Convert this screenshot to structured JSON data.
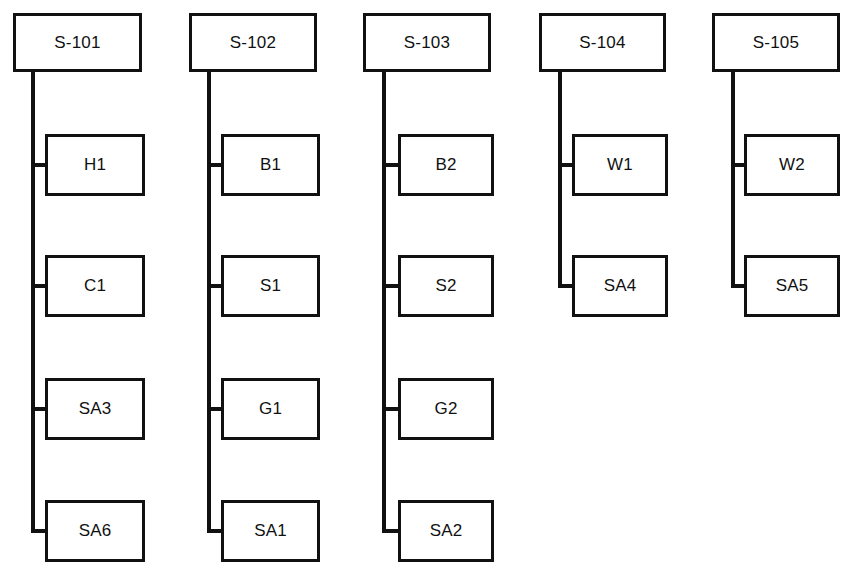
{
  "diagram": {
    "type": "hierarchical-block-diagram",
    "background_color": "#ffffff",
    "line_color": "#111111",
    "box_fill_color": "#ffffff",
    "columns": [
      {
        "id": "column-1",
        "header": {
          "label": "S-101",
          "x": 13,
          "y": 13,
          "w": 129,
          "h": 59
        },
        "trunk": {
          "x": 33,
          "y_top": 72,
          "y_bottom": 531
        },
        "children": [
          {
            "label": "H1",
            "x": 45,
            "y": 134,
            "w": 100,
            "h": 62,
            "connector_y": 165
          },
          {
            "label": "C1",
            "x": 45,
            "y": 255,
            "w": 100,
            "h": 62,
            "connector_y": 286
          },
          {
            "label": "SA3",
            "x": 45,
            "y": 378,
            "w": 100,
            "h": 62,
            "connector_y": 409
          },
          {
            "label": "SA6",
            "x": 45,
            "y": 500,
            "w": 100,
            "h": 62,
            "connector_y": 531
          }
        ]
      },
      {
        "id": "column-2",
        "header": {
          "label": "S-102",
          "x": 189,
          "y": 13,
          "w": 128,
          "h": 59
        },
        "trunk": {
          "x": 209,
          "y_top": 72,
          "y_bottom": 531
        },
        "children": [
          {
            "label": "B1",
            "x": 221,
            "y": 134,
            "w": 99,
            "h": 62,
            "connector_y": 165
          },
          {
            "label": "S1",
            "x": 221,
            "y": 255,
            "w": 99,
            "h": 62,
            "connector_y": 286
          },
          {
            "label": "G1",
            "x": 221,
            "y": 378,
            "w": 99,
            "h": 62,
            "connector_y": 409
          },
          {
            "label": "SA1",
            "x": 221,
            "y": 500,
            "w": 99,
            "h": 62,
            "connector_y": 531
          }
        ]
      },
      {
        "id": "column-3",
        "header": {
          "label": "S-103",
          "x": 363,
          "y": 13,
          "w": 128,
          "h": 59
        },
        "trunk": {
          "x": 384,
          "y_top": 72,
          "y_bottom": 531
        },
        "children": [
          {
            "label": "B2",
            "x": 398,
            "y": 134,
            "w": 96,
            "h": 62,
            "connector_y": 165
          },
          {
            "label": "S2",
            "x": 398,
            "y": 255,
            "w": 96,
            "h": 62,
            "connector_y": 286
          },
          {
            "label": "G2",
            "x": 398,
            "y": 378,
            "w": 96,
            "h": 62,
            "connector_y": 409
          },
          {
            "label": "SA2",
            "x": 398,
            "y": 500,
            "w": 96,
            "h": 62,
            "connector_y": 531
          }
        ]
      },
      {
        "id": "column-4",
        "header": {
          "label": "S-104",
          "x": 539,
          "y": 13,
          "w": 127,
          "h": 59
        },
        "trunk": {
          "x": 560,
          "y_top": 72,
          "y_bottom": 286
        },
        "children": [
          {
            "label": "W1",
            "x": 572,
            "y": 134,
            "w": 96,
            "h": 62,
            "connector_y": 165
          },
          {
            "label": "SA4",
            "x": 572,
            "y": 255,
            "w": 96,
            "h": 62,
            "connector_y": 286
          }
        ]
      },
      {
        "id": "column-5",
        "header": {
          "label": "S-105",
          "x": 712,
          "y": 13,
          "w": 128,
          "h": 59
        },
        "trunk": {
          "x": 733,
          "y_top": 72,
          "y_bottom": 286
        },
        "children": [
          {
            "label": "W2",
            "x": 744,
            "y": 134,
            "w": 96,
            "h": 62,
            "connector_y": 165
          },
          {
            "label": "SA5",
            "x": 744,
            "y": 255,
            "w": 96,
            "h": 62,
            "connector_y": 286
          }
        ]
      }
    ]
  }
}
